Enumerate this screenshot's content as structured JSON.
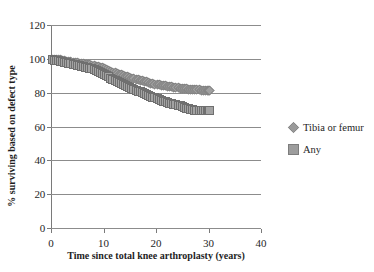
{
  "chart_data": {
    "type": "line",
    "title": "",
    "xlabel": "Time since total knee arthroplasty (years)",
    "ylabel": "% surviving based on defect type",
    "xlim": [
      0,
      40
    ],
    "ylim": [
      0,
      120
    ],
    "xticks": [
      0,
      10,
      20,
      30,
      40
    ],
    "yticks": [
      0,
      20,
      40,
      60,
      80,
      100,
      120
    ],
    "grid": true,
    "legend_position": "right",
    "marker_style": [
      "diamond",
      "square"
    ],
    "series": [
      {
        "name": "Tibia or femur",
        "marker": "diamond",
        "color": "#a0a0a0",
        "x": [
          0.0,
          0.8,
          1.6,
          2.4,
          3.2,
          4.0,
          4.8,
          5.6,
          6.4,
          7.2,
          8.0,
          8.8,
          9.6,
          10.4,
          11.2,
          12.0,
          12.8,
          13.6,
          14.4,
          15.2,
          16.0,
          16.8,
          17.6,
          18.4,
          19.2,
          20.0,
          20.8,
          21.6,
          22.4,
          23.2,
          24.0,
          24.8,
          25.6,
          26.4,
          27.2,
          28.0,
          28.8,
          29.6,
          30.0
        ],
        "y": [
          100,
          100,
          100,
          99.5,
          99.0,
          98.6,
          98.2,
          97.8,
          97.4,
          97.0,
          96.6,
          96.0,
          95.2,
          94.2,
          93.2,
          92.4,
          91.6,
          90.8,
          90.0,
          89.2,
          88.4,
          87.8,
          87.2,
          86.6,
          86.0,
          85.4,
          85.0,
          84.6,
          84.2,
          83.8,
          83.4,
          83.0,
          82.8,
          82.6,
          82.4,
          82.2,
          82.1,
          82.0,
          82.0
        ]
      },
      {
        "name": "Any",
        "marker": "square",
        "color": "#a3a3a3",
        "x": [
          0.0,
          0.8,
          1.6,
          2.4,
          3.2,
          4.0,
          4.8,
          5.6,
          6.4,
          7.2,
          8.0,
          8.8,
          9.6,
          10.4,
          11.2,
          12.0,
          12.8,
          13.6,
          14.4,
          15.2,
          16.0,
          16.8,
          17.6,
          18.4,
          19.2,
          20.0,
          20.8,
          21.6,
          22.4,
          23.2,
          24.0,
          24.8,
          25.6,
          26.4,
          27.2,
          28.0,
          28.8,
          29.6,
          30.0
        ],
        "y": [
          100,
          99.6,
          99.2,
          98.6,
          98.0,
          97.4,
          96.8,
          96.2,
          95.6,
          95.0,
          94.4,
          93.2,
          92.0,
          90.6,
          89.2,
          88.0,
          86.8,
          85.6,
          84.4,
          83.2,
          82.0,
          81.0,
          80.0,
          79.0,
          78.0,
          77.0,
          76.0,
          75.2,
          74.4,
          73.8,
          73.2,
          72.6,
          71.4,
          70.6,
          70.2,
          70.0,
          70.0,
          70.0,
          70.0
        ]
      }
    ]
  },
  "legend": {
    "items": [
      {
        "label": "Tibia or femur"
      },
      {
        "label": "Any"
      }
    ]
  }
}
